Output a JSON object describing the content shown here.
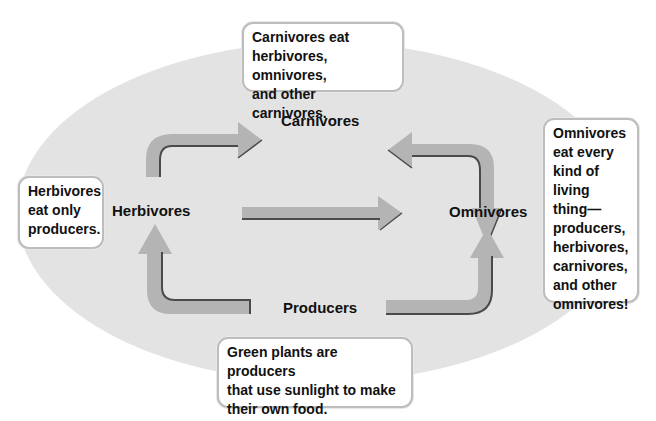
{
  "diagram": {
    "type": "food-web",
    "colors": {
      "ellipse_fill": "#e3e3e3",
      "arrow_fill": "#b4b4b4",
      "arrow_edge": "#4a4a4a",
      "callout_border": "#bdbdbd"
    },
    "nodes": {
      "carnivores": "Carnivores",
      "herbivores": "Herbivores",
      "omnivores": "Omnivores",
      "producers": "Producers"
    },
    "edges": [
      {
        "from": "Herbivores",
        "to": "Carnivores"
      },
      {
        "from": "Omnivores",
        "to": "Carnivores"
      },
      {
        "from": "Carnivores",
        "to": "Omnivores"
      },
      {
        "from": "Herbivores",
        "to": "Omnivores"
      },
      {
        "from": "Producers",
        "to": "Herbivores"
      },
      {
        "from": "Producers",
        "to": "Omnivores"
      }
    ],
    "callouts": {
      "carnivores": "Carnivores eat\nherbivores, omnivores,\nand other carnivores.",
      "herbivores": "Herbivores\neat only\nproducers.",
      "omnivores": "Omnivores\neat every\nkind of living\nthing—\nproducers,\nherbivores,\ncarnivores,\nand other\nomnivores!",
      "producers": "Green plants are producers\nthat use sunlight to make\ntheir own food."
    }
  }
}
